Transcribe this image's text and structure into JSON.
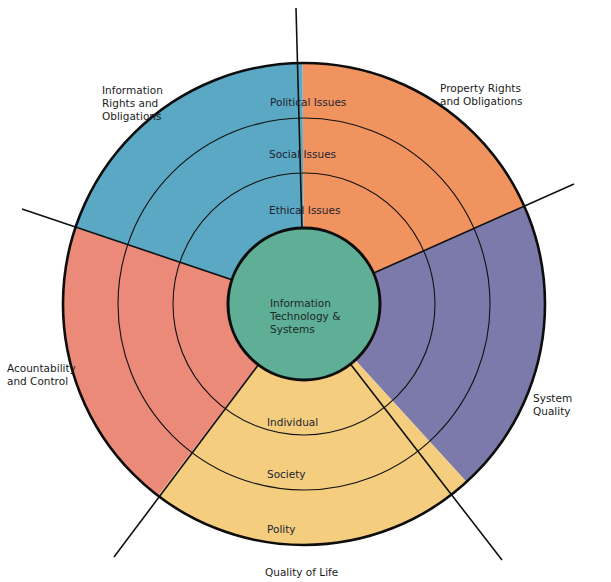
{
  "diagram": {
    "title": "",
    "center": {
      "label": "Information\nTechnology &\nSystems",
      "color": "#5fae96"
    },
    "rings": [
      {
        "name": "inner",
        "label": "Ethical Issues"
      },
      {
        "name": "middle",
        "label": "Social Issues"
      },
      {
        "name": "outer",
        "label": "Political Issues"
      }
    ],
    "quality_of_life_rings": [
      {
        "name": "inner",
        "label": "Individual"
      },
      {
        "name": "middle",
        "label": "Society"
      },
      {
        "name": "outer",
        "label": "Polity"
      }
    ],
    "dimensions": [
      {
        "id": "information-rights",
        "label": "Information\nRights and\nObligations",
        "color": "#5aa8c4"
      },
      {
        "id": "property-rights",
        "label": "Property Rights\nand Obligations",
        "color": "#f0935f"
      },
      {
        "id": "system-quality",
        "label": "System Quality",
        "color": "#7b7aaa"
      },
      {
        "id": "quality-of-life",
        "label": "Quality of Life",
        "color": "#f4cd7e"
      },
      {
        "id": "accountability",
        "label": "Acountability\nand Control",
        "color": "#ec8a7a"
      }
    ]
  }
}
